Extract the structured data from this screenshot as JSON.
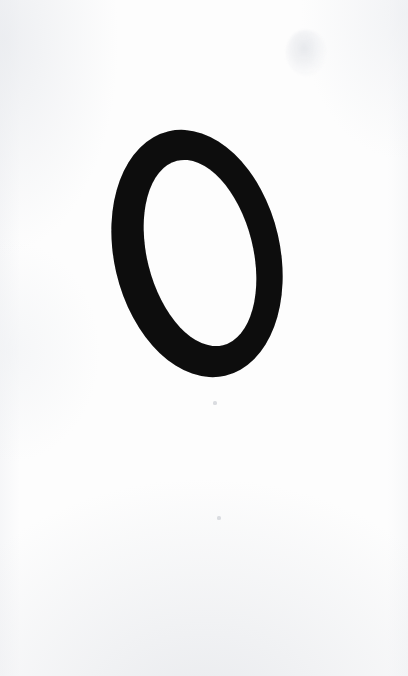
{
  "page": {
    "kind": "scanned-page",
    "width": 408,
    "height": 676,
    "background_color": "#fdfdfd",
    "ink_color": "#0a0a0a"
  },
  "content": {
    "glyph": {
      "character": "O",
      "style": "italic-serif",
      "color": "#0a0a0a",
      "slant_degrees": 13,
      "bounds": {
        "x": 114,
        "y": 128,
        "width": 166,
        "height": 251
      },
      "counter": {
        "x": 147,
        "y": 158,
        "width": 106,
        "height": 190
      },
      "stroke_thin_px": 28,
      "stroke_thick_px": 33
    }
  },
  "artifacts": {
    "smudge": {
      "label": "scan-smudge",
      "x": 286,
      "y": 30,
      "width": 40,
      "height": 46
    },
    "specks": [
      {
        "label": "speck-upper",
        "x": 213,
        "y": 401
      },
      {
        "label": "speck-lower",
        "x": 217,
        "y": 516
      }
    ],
    "edge_shading": "subtle gray vignetting along left, right and bottom margins"
  }
}
